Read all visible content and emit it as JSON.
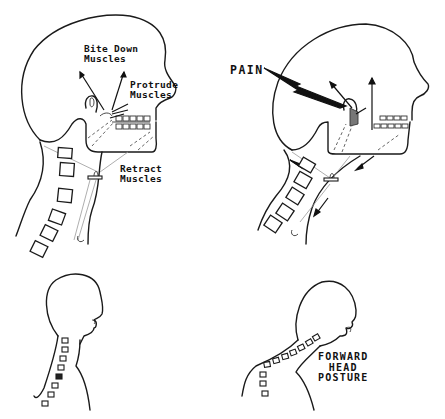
{
  "figure": {
    "panels": [
      {
        "id": "top-left",
        "description": "Normal head with jaw muscles",
        "labels": {
          "bite_down": [
            "Bite Down",
            "Muscles"
          ],
          "protrude": [
            "Protrude",
            "Muscles"
          ],
          "retract": [
            "Retract",
            "Muscles"
          ]
        }
      },
      {
        "id": "top-right",
        "description": "Forward head with TMJ pain",
        "labels": {
          "pain": "PAIN"
        }
      },
      {
        "id": "bottom-left",
        "description": "Normal upright posture silhouette"
      },
      {
        "id": "bottom-right",
        "description": "Forward head posture silhouette",
        "labels": {
          "forward_head_posture": [
            "FORWARD",
            "HEAD",
            "POSTURE"
          ]
        }
      }
    ],
    "colors": {
      "ink": "#1a1a1a",
      "background": "#ffffff"
    }
  }
}
